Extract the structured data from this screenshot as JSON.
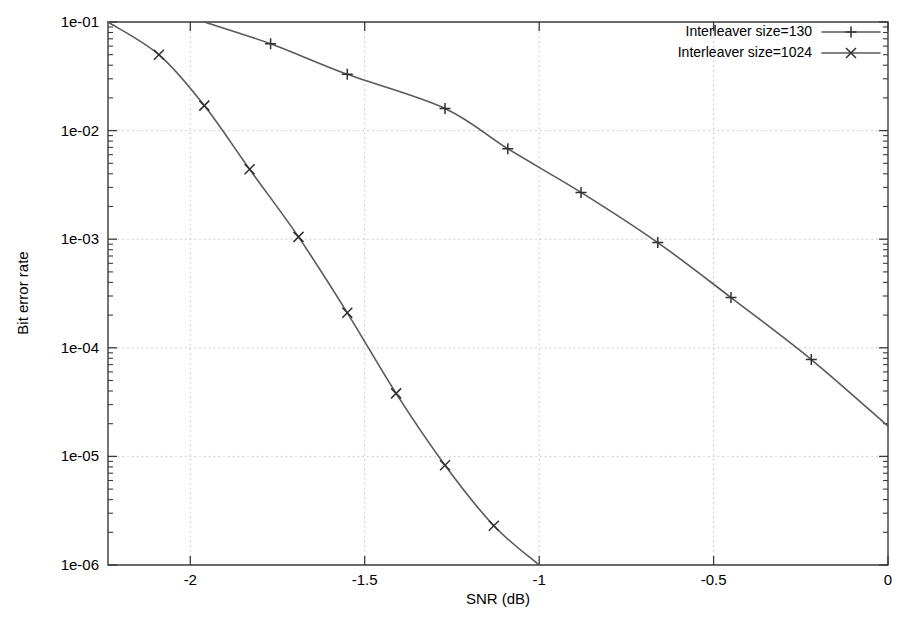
{
  "chart_data": {
    "type": "line",
    "title": "",
    "xlabel": "SNR (dB)",
    "ylabel": "Bit error rate",
    "xlim": [
      -2.236,
      0
    ],
    "ylim": [
      1e-06,
      0.1
    ],
    "yscale": "log",
    "xscale": "linear",
    "grid": true,
    "legend_position": "top-right",
    "xticks": [
      -2,
      -1.5,
      -1,
      -0.5,
      0
    ],
    "xtick_labels": [
      "-2",
      "-1.5",
      "-1",
      "-0.5",
      "0"
    ],
    "yticks": [
      0.1,
      0.01,
      0.001,
      0.0001,
      1e-05,
      1e-06
    ],
    "ytick_labels": [
      "1e-01",
      "1e-02",
      "1e-03",
      "1e-04",
      "1e-05",
      "1e-06"
    ],
    "series": [
      {
        "name": "Interleaver size=130",
        "marker": "plus",
        "x": [
          -1.96,
          -1.77,
          -1.55,
          -1.27,
          -1.09,
          -0.88,
          -0.66,
          -0.45,
          -0.22,
          0.0
        ],
        "y": [
          0.1,
          0.063,
          0.033,
          0.016,
          0.0068,
          0.0027,
          0.00093,
          0.00029,
          7.8e-05,
          1.9e-05
        ]
      },
      {
        "name": "Interleaver size=1024",
        "marker": "cross",
        "x": [
          -2.236,
          -2.09,
          -1.96,
          -1.83,
          -1.69,
          -1.55,
          -1.41,
          -1.27,
          -1.13,
          -1.0
        ],
        "y": [
          0.1,
          0.05,
          0.017,
          0.0044,
          0.00105,
          0.00021,
          3.8e-05,
          8.3e-06,
          2.3e-06,
          1e-06
        ]
      }
    ]
  },
  "legend": {
    "entries": [
      {
        "label": "Interleaver size=130"
      },
      {
        "label": "Interleaver size=1024"
      }
    ]
  },
  "axes": {
    "x_title": "SNR (dB)",
    "y_title": "Bit error rate"
  },
  "colors": {
    "line": "#59595b",
    "frame": "#3a3a3a",
    "grid": "#bdbdbd",
    "text": "#000000",
    "background": "#ffffff"
  }
}
